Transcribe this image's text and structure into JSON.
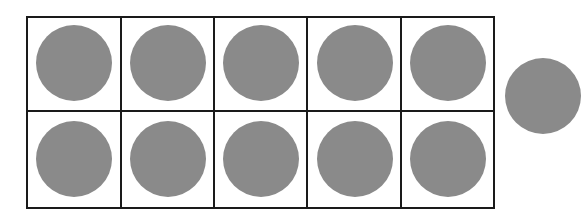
{
  "diagram": {
    "type": "ten-frame",
    "rows": 2,
    "columns": 5,
    "filled_cells": 10,
    "counters_outside_frame": 1,
    "total_counters": 11,
    "colors": {
      "grid_line": "#1a1a1a",
      "counter_fill": "#8a8a8a",
      "background": "#ffffff"
    }
  }
}
